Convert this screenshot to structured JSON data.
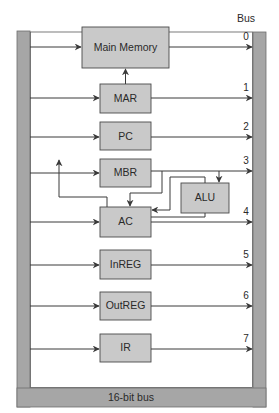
{
  "title": "Bus",
  "bus_label": "16-bit bus",
  "colors": {
    "box_fill": "#c9c9c9",
    "bus_fill": "#a6a6a6",
    "line": "#3a3a3a"
  },
  "components": [
    {
      "id": "main-memory",
      "label": "Main Memory",
      "bus_line": "0"
    },
    {
      "id": "mar",
      "label": "MAR",
      "bus_line": "1"
    },
    {
      "id": "pc",
      "label": "PC",
      "bus_line": "2"
    },
    {
      "id": "mbr",
      "label": "MBR",
      "bus_line": "3"
    },
    {
      "id": "ac",
      "label": "AC",
      "bus_line": "4"
    },
    {
      "id": "inreg",
      "label": "InREG",
      "bus_line": "5"
    },
    {
      "id": "outreg",
      "label": "OutREG",
      "bus_line": "6"
    },
    {
      "id": "ir",
      "label": "IR",
      "bus_line": "7"
    }
  ],
  "alu": {
    "label": "ALU"
  }
}
